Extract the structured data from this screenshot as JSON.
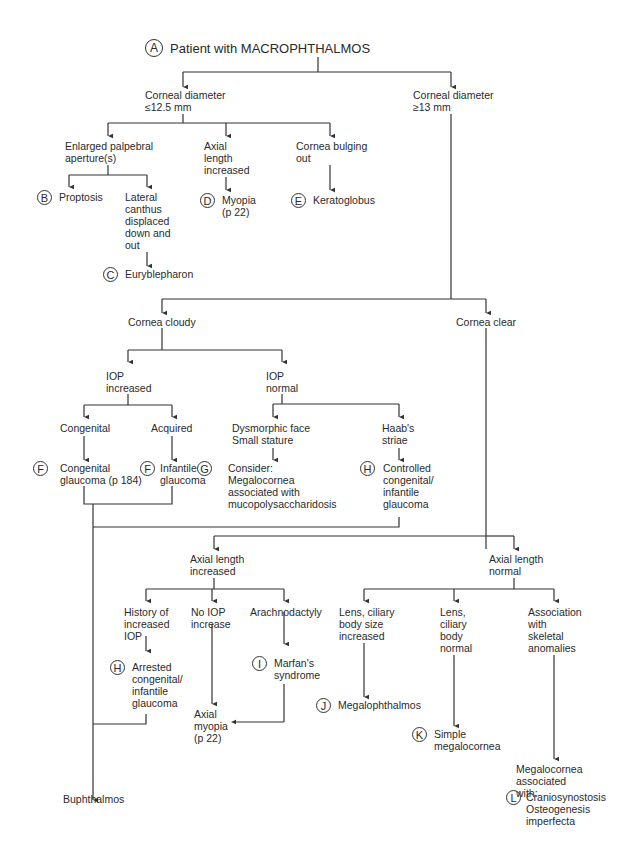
{
  "diagram": {
    "title": "Patient with MACROPHTHALMOS",
    "nodes": {
      "root": {
        "badge": "A",
        "label": "Patient with MACROPHTHALMOS"
      },
      "cd_small": {
        "label": "Corneal diameter\n≤12.5 mm"
      },
      "cd_large": {
        "label": "Corneal diameter\n≥13 mm"
      },
      "enlarged_palpebral": {
        "label": "Enlarged palpebral\naperture(s)"
      },
      "axial_increased_top": {
        "label": "Axial\nlength\nincreased"
      },
      "cornea_bulging": {
        "label": "Cornea bulging\nout"
      },
      "proptosis": {
        "badge": "B",
        "label": "Proptosis"
      },
      "lateral_canthus": {
        "label": "Lateral\ncanthus\ndisplaced\ndown and\nout"
      },
      "euryblepharon": {
        "badge": "C",
        "label": "Euryblepharon"
      },
      "myopia": {
        "badge": "D",
        "label": "Myopia\n(p 22)"
      },
      "keratoglobus": {
        "badge": "E",
        "label": "Keratoglobus"
      },
      "cornea_cloudy": {
        "label": "Cornea cloudy"
      },
      "cornea_clear": {
        "label": "Cornea clear"
      },
      "iop_increased": {
        "label": "IOP\nincreased"
      },
      "iop_normal": {
        "label": "IOP\nnormal"
      },
      "congenital": {
        "label": "Congenital"
      },
      "acquired": {
        "label": "Acquired"
      },
      "dysmorphic": {
        "label": "Dysmorphic face\nSmall stature"
      },
      "haabs": {
        "label": "Haab's\nstriae"
      },
      "congenital_glaucoma": {
        "badge": "F",
        "label": "Congenital\nglaucoma (p 184)"
      },
      "infantile_glaucoma": {
        "badge": "F",
        "label": "Infantile\nglaucoma"
      },
      "consider_mps": {
        "badge": "G",
        "label": "Consider:\n   Megalocornea\n   associated with\n   mucopolysaccharidosis"
      },
      "controlled_glaucoma": {
        "badge": "H",
        "label": "Controlled\ncongenital/\ninfantile\nglaucoma"
      },
      "axial_increased": {
        "label": "Axial length\nincreased"
      },
      "axial_normal": {
        "label": "Axial length\nnormal"
      },
      "history_iop": {
        "label": "History of\nincreased\nIOP"
      },
      "no_iop": {
        "label": "No IOP\nincrease"
      },
      "arachnodactyly": {
        "label": "Arachnodactyly"
      },
      "arrested_glaucoma": {
        "badge": "H",
        "label": "Arrested\ncongenital/\ninfantile\nglaucoma"
      },
      "marfans": {
        "badge": "I",
        "label": "Marfan's\nsyndrome"
      },
      "axial_myopia": {
        "label": "Axial\nmyopia\n(p 22)"
      },
      "lens_increased": {
        "label": "Lens, ciliary\nbody size\nincreased"
      },
      "lens_normal": {
        "label": "Lens,\nciliary\nbody\nnormal"
      },
      "skeletal": {
        "label": "Association\nwith\nskeletal\nanomalies"
      },
      "megalophthalmos": {
        "badge": "J",
        "label": "Megalophthalmos"
      },
      "simple_megalocornea": {
        "badge": "K",
        "label": "Simple\nmegalocornea"
      },
      "megalocornea_assoc": {
        "label": "Megalocornea\nassociated\nwith:"
      },
      "skeletal_list": {
        "badge": "L",
        "label": "Craniosynostosis\nOsteogenesis\n   imperfecta"
      },
      "buphthalmos": {
        "label": "Buphthalmos"
      }
    }
  }
}
